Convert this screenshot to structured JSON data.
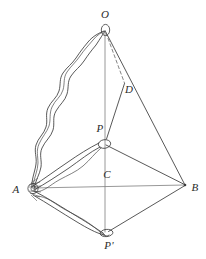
{
  "figure": {
    "kind": "geometry-diagram",
    "background_color": "#ffffff",
    "stroke_color": "#3a3a3a",
    "dashed_stroke_color": "#6e6e6e",
    "sketch_stroke_color": "#2f2f2f",
    "width": 206,
    "height": 259
  },
  "labels": [
    {
      "id": "O",
      "text": "O",
      "x": 105,
      "y": 14,
      "name": "vertex-label-o"
    },
    {
      "id": "D",
      "text": "D",
      "x": 129,
      "y": 89,
      "name": "vertex-label-d"
    },
    {
      "id": "P",
      "text": "P",
      "x": 100,
      "y": 128,
      "name": "vertex-label-p"
    },
    {
      "id": "C",
      "text": "C",
      "x": 107,
      "y": 174,
      "name": "vertex-label-c"
    },
    {
      "id": "A",
      "text": "A",
      "x": 16,
      "y": 189,
      "name": "vertex-label-a"
    },
    {
      "id": "B",
      "text": "B",
      "x": 195,
      "y": 187,
      "name": "vertex-label-b"
    },
    {
      "id": "Pp",
      "text": "P'",
      "x": 109,
      "y": 245,
      "name": "vertex-label-p-prime"
    }
  ],
  "points": {
    "O": {
      "x": 105,
      "y": 31
    },
    "A": {
      "x": 33,
      "y": 188
    },
    "B": {
      "x": 185,
      "y": 185
    },
    "C": {
      "x": 105,
      "y": 185
    },
    "P": {
      "x": 105,
      "y": 142
    },
    "Pp": {
      "x": 107,
      "y": 232
    },
    "D": {
      "x": 124,
      "y": 84
    }
  },
  "edges": [
    {
      "name": "edge-o-b",
      "from": "O",
      "to": "B",
      "style": "solid"
    },
    {
      "name": "edge-o-c-axis",
      "from": "O",
      "to": "Pp",
      "style": "solid"
    },
    {
      "name": "edge-a-b",
      "from": "A",
      "to": "B",
      "style": "solid"
    },
    {
      "name": "edge-p-b",
      "from": "P",
      "to": "B",
      "style": "solid"
    },
    {
      "name": "edge-b-p-prime",
      "from": "B",
      "to": "Pp",
      "style": "solid"
    },
    {
      "name": "edge-d-p",
      "from": "D",
      "to": "P",
      "style": "solid"
    },
    {
      "name": "edge-o-d",
      "from": "O",
      "to": "D",
      "style": "dashed"
    }
  ],
  "sketch_edges": [
    {
      "name": "sketch-edge-a-o",
      "from": "A",
      "to": "O",
      "style": "wavy-double"
    },
    {
      "name": "sketch-edge-a-p",
      "from": "A",
      "to": "P",
      "style": "wavy-double"
    },
    {
      "name": "sketch-edge-a-p-prime",
      "from": "A",
      "to": "Pp",
      "style": "wavy-double"
    }
  ],
  "markers": [
    {
      "name": "node-ellipse-o",
      "at": "O",
      "shape": "ellipse"
    },
    {
      "name": "node-ellipse-p",
      "at": "P",
      "shape": "ellipse"
    },
    {
      "name": "node-ellipse-p-prime",
      "at": "Pp",
      "shape": "ellipse"
    },
    {
      "name": "node-circle-a",
      "at": "A",
      "shape": "circle"
    }
  ]
}
